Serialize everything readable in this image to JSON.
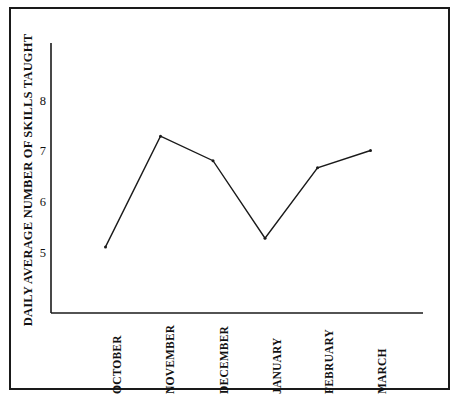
{
  "chart_data": {
    "type": "line",
    "title": "",
    "xlabel": "",
    "ylabel": "DAILY AVERAGE NUMBER OF SKILLS TAUGHT",
    "categories": [
      "OCTOBER",
      "NOVEMBER",
      "DECEMBER",
      "JANUARY",
      "FEBRUARY",
      "MARCH"
    ],
    "values": [
      5.1,
      7.27,
      6.79,
      5.27,
      6.65,
      6.99
    ],
    "yticks": [
      5,
      6,
      7,
      8
    ],
    "ytick_labels": [
      "5",
      "6",
      "7",
      "8"
    ],
    "ylim": [
      4.0,
      8.7
    ],
    "grid": false,
    "legend": false,
    "series": [
      {
        "name": "Daily average number of skills taught",
        "values": [
          5.1,
          7.27,
          6.79,
          5.27,
          6.65,
          6.99
        ]
      }
    ],
    "line_color": "#1a1a1a",
    "marker": "dot",
    "axis_color": "#1a1a1a",
    "background_color": "#ffffff"
  },
  "figure": {
    "frame_color": "#1a1a1a",
    "y_axis_title": "DAILY AVERAGE NUMBER OF SKILLS TAUGHT",
    "y_labels": [
      "8",
      "7",
      "6",
      "5"
    ],
    "x_labels": [
      "OCTOBER",
      "NOVEMBER",
      "DECEMBER",
      "JANUARY",
      "FEBRUARY",
      "MARCH"
    ]
  }
}
